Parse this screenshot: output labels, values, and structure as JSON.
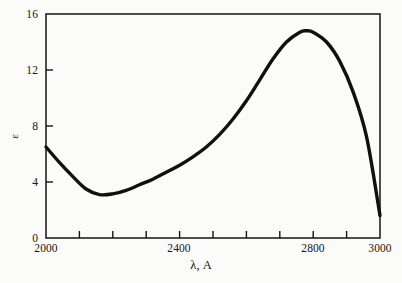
{
  "figure": {
    "background_color": "#fbfbf9",
    "ink_color": "#101010"
  },
  "axes": {
    "x_title": "λ, A",
    "y_title": "ε",
    "x_tick_labels": [
      "2000",
      "2400",
      "2800",
      "3000"
    ],
    "y_tick_labels": [
      "0",
      "4",
      "8",
      "12",
      "16"
    ]
  },
  "chart_data": {
    "type": "line",
    "title": "",
    "subtitle": "",
    "xlabel": "λ, A",
    "ylabel": "ε",
    "xlim": [
      2000,
      3000
    ],
    "ylim": [
      0,
      16
    ],
    "grid": false,
    "legend": false,
    "x_major_ticks": [
      2000,
      2400,
      2800,
      3000
    ],
    "x_minor_tick_interval": 100,
    "x_minor_ticks": [
      2100,
      2200,
      2300,
      2500,
      2600,
      2700,
      2900
    ],
    "y_major_ticks": [
      0,
      4,
      8,
      12,
      16
    ],
    "tick_direction": "in",
    "series": [
      {
        "name": "absorption",
        "color": "#101010",
        "line_width": 3.4,
        "x": [
          2000,
          2040,
          2080,
          2120,
          2160,
          2200,
          2240,
          2280,
          2320,
          2360,
          2400,
          2440,
          2480,
          2520,
          2560,
          2600,
          2640,
          2680,
          2720,
          2760,
          2780,
          2800,
          2840,
          2880,
          2920,
          2960,
          3000
        ],
        "y": [
          6.5,
          5.4,
          4.4,
          3.5,
          3.1,
          3.15,
          3.4,
          3.8,
          4.2,
          4.7,
          5.2,
          5.8,
          6.5,
          7.4,
          8.5,
          9.8,
          11.3,
          12.8,
          14.0,
          14.7,
          14.8,
          14.7,
          14.0,
          12.6,
          10.4,
          7.2,
          1.6
        ]
      }
    ],
    "annotations": {
      "minimum": {
        "x": 2160,
        "y": 3.1
      },
      "maximum": {
        "x": 2780,
        "y": 14.8
      },
      "left_endpoint": {
        "x": 2000,
        "y": 6.5
      },
      "right_endpoint": {
        "x": 3000,
        "y": 1.6
      }
    }
  }
}
